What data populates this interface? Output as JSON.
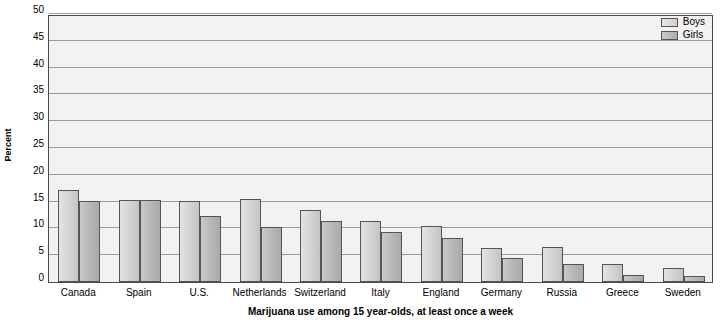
{
  "chart_data": {
    "type": "bar",
    "title": "",
    "xlabel": "Marijuana use among 15 year-olds, at least once a week",
    "ylabel": "Percent",
    "ylim": [
      0,
      50
    ],
    "ytick_step": 5,
    "yticks": [
      0,
      5,
      10,
      15,
      20,
      25,
      30,
      35,
      40,
      45,
      50
    ],
    "ytick_labels": [
      "0",
      "5",
      "10",
      "15",
      "20",
      "25",
      "30",
      "35",
      "40",
      "45",
      "50"
    ],
    "grid": true,
    "legend_position": "top-right",
    "categories": [
      "Canada",
      "Spain",
      "U.S.",
      "Netherlands",
      "Switzerland",
      "Italy",
      "England",
      "Germany",
      "Russia",
      "Greece",
      "Sweden"
    ],
    "series": [
      {
        "name": "Boys",
        "color": "#d4d4d4",
        "values": [
          17.2,
          15.3,
          15.2,
          15.4,
          13.4,
          11.3,
          10.4,
          6.3,
          6.5,
          3.4,
          2.6
        ]
      },
      {
        "name": "Girls",
        "color": "#b3b3b3",
        "values": [
          15.2,
          15.3,
          12.3,
          10.2,
          11.4,
          9.4,
          8.3,
          4.5,
          3.4,
          1.3,
          1.2
        ]
      }
    ]
  },
  "legend": {
    "items": [
      {
        "label": "Boys",
        "key": "boys"
      },
      {
        "label": "Girls",
        "key": "girls"
      }
    ]
  }
}
